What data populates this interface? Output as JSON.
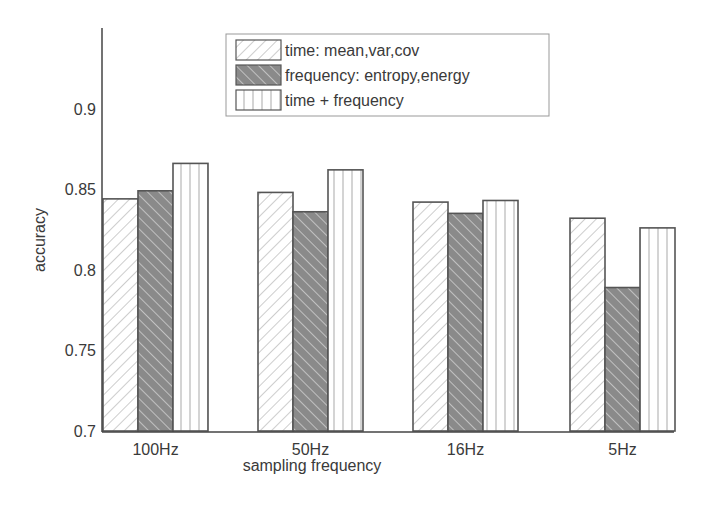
{
  "chart_data": {
    "type": "bar",
    "title": "",
    "xlabel": "sampling frequency",
    "ylabel": "accuracy",
    "ylim": [
      0.7,
      0.93
    ],
    "yticks": [
      0.7,
      0.75,
      0.8,
      0.85,
      0.9
    ],
    "ytick_labels": [
      "0.7",
      "0.75",
      "0.8",
      "0.85",
      "0.9"
    ],
    "categories": [
      "100Hz",
      "50Hz",
      "16Hz",
      "5Hz"
    ],
    "series": [
      {
        "name": "time: mean,var,cov",
        "pattern": "hatch-light-forward",
        "values": [
          0.844,
          0.848,
          0.842,
          0.832
        ]
      },
      {
        "name": "frequency: entropy,energy",
        "pattern": "hatch-dark-backward",
        "values": [
          0.849,
          0.836,
          0.835,
          0.789
        ]
      },
      {
        "name": "time + frequency",
        "pattern": "vertical-lines",
        "values": [
          0.866,
          0.862,
          0.843,
          0.826
        ]
      }
    ],
    "grid": false,
    "legend_position": "upper center, inside axes"
  },
  "colors": {
    "axis": "#444444",
    "text": "#3a3a3a",
    "bar_outline": "#555555",
    "hatch_light": "#b8b8b8",
    "hatch_dark_fill": "#8a8a8a",
    "hatch_dark_line": "#d0d0d0",
    "vline": "#aaaaaa"
  }
}
